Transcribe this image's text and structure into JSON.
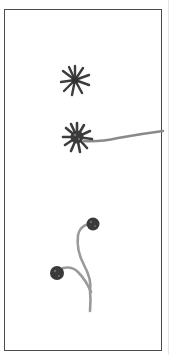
{
  "figure": {
    "colors": {
      "ink_dark": "#3a3a3a",
      "stalk": "#8a8a8a",
      "frame": "#4a4a4a",
      "background": "#ffffff"
    },
    "specimens": [
      {
        "name": "star-cell",
        "cx": 75,
        "cy": 80,
        "rays": 10
      },
      {
        "name": "star-cell-with-stalk",
        "cx": 77,
        "cy": 137,
        "rays": 12
      },
      {
        "name": "branched-stalk-head-upper",
        "cx": 93,
        "cy": 224
      },
      {
        "name": "branched-stalk-head-lower",
        "cx": 57,
        "cy": 273
      }
    ]
  }
}
